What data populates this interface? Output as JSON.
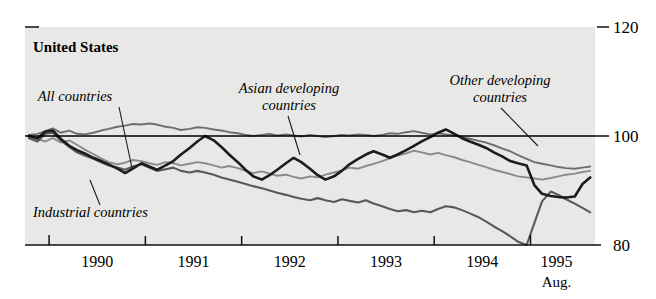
{
  "chart_data": {
    "type": "line",
    "title": "United States",
    "xlabel": "",
    "ylabel": "",
    "ylim": [
      80,
      120
    ],
    "yticks": [
      80,
      100,
      120
    ],
    "ytick_labels": [
      "80",
      "100",
      "120"
    ],
    "xlim": [
      1989.75,
      1995.67
    ],
    "xticks": [
      1990,
      1991,
      1992,
      1993,
      1994,
      1995
    ],
    "xtick_labels": [
      "1990",
      "1991",
      "1992",
      "1993",
      "1994",
      "1995"
    ],
    "x_end_note": "Aug.",
    "grid": false,
    "legend_position": "inline-annotations",
    "reference_line": 100,
    "annotations": [
      {
        "text": "All countries",
        "x": 1990.55,
        "y": 112.0
      },
      {
        "text": "Asian developing countries",
        "x": 1992.05,
        "y": 113.5
      },
      {
        "text": "Other developing countries",
        "x": 1994.35,
        "y": 114.5
      },
      {
        "text": "Industrial countries",
        "x": 1990.65,
        "y": 85.5
      }
    ],
    "x": [
      1989.79,
      1989.88,
      1989.96,
      1990.04,
      1990.12,
      1990.21,
      1990.29,
      1990.37,
      1990.46,
      1990.54,
      1990.62,
      1990.71,
      1990.79,
      1990.87,
      1990.96,
      1991.04,
      1991.12,
      1991.21,
      1991.29,
      1991.37,
      1991.46,
      1991.54,
      1991.62,
      1991.71,
      1991.79,
      1991.87,
      1991.96,
      1992.04,
      1992.12,
      1992.21,
      1992.29,
      1992.37,
      1992.46,
      1992.54,
      1992.62,
      1992.71,
      1992.79,
      1992.87,
      1992.96,
      1993.04,
      1993.12,
      1993.21,
      1993.29,
      1993.37,
      1993.46,
      1993.54,
      1993.62,
      1993.71,
      1993.79,
      1993.87,
      1993.96,
      1994.04,
      1994.12,
      1994.21,
      1994.29,
      1994.37,
      1994.46,
      1994.54,
      1994.62,
      1994.71,
      1994.79,
      1994.87,
      1994.96,
      1995.04,
      1995.12,
      1995.21,
      1995.29,
      1995.37,
      1995.46,
      1995.54,
      1995.62
    ],
    "series": [
      {
        "name": "All countries",
        "color": "#6e6e6e",
        "width": 1.9,
        "values": [
          100.2,
          100.4,
          100.9,
          101.4,
          100.6,
          101.0,
          100.4,
          100.3,
          100.6,
          101.0,
          101.3,
          101.7,
          101.9,
          102.2,
          102.1,
          102.3,
          102.1,
          101.7,
          101.5,
          101.1,
          101.3,
          101.6,
          101.5,
          101.2,
          101.0,
          100.7,
          100.5,
          100.2,
          100.0,
          100.2,
          100.4,
          100.1,
          100.3,
          100.1,
          99.9,
          100.2,
          100.0,
          99.8,
          100.0,
          100.2,
          100.1,
          100.3,
          100.2,
          100.0,
          100.2,
          100.5,
          100.4,
          100.7,
          100.9,
          100.6,
          100.3,
          100.5,
          100.3,
          100.1,
          99.8,
          99.5,
          99.1,
          98.8,
          98.3,
          97.7,
          97.2,
          96.5,
          95.8,
          95.2,
          94.9,
          94.6,
          94.3,
          94.1,
          94.0,
          94.2,
          94.4
        ]
      },
      {
        "name": "Asian developing countries",
        "color": "#8a8a8a",
        "width": 1.9,
        "values": [
          99.8,
          99.4,
          99.0,
          99.6,
          98.8,
          99.2,
          98.4,
          97.5,
          96.7,
          95.9,
          95.2,
          94.8,
          95.1,
          95.6,
          95.4,
          95.0,
          94.7,
          95.2,
          95.0,
          94.6,
          94.9,
          95.2,
          95.0,
          94.6,
          94.2,
          94.5,
          94.1,
          93.6,
          93.2,
          93.5,
          93.1,
          92.7,
          92.9,
          92.5,
          92.2,
          92.6,
          92.4,
          92.9,
          93.3,
          93.7,
          94.2,
          94.0,
          94.5,
          94.9,
          95.4,
          95.9,
          96.4,
          96.8,
          97.3,
          97.0,
          96.6,
          96.9,
          96.5,
          96.1,
          95.6,
          95.2,
          94.7,
          94.3,
          93.8,
          93.4,
          93.0,
          92.6,
          92.4,
          92.2,
          92.0,
          92.3,
          92.6,
          92.9,
          93.1,
          93.4,
          93.6
        ]
      },
      {
        "name": "Industrial countries",
        "color": "#595959",
        "width": 2.1,
        "values": [
          99.6,
          99.0,
          100.4,
          100.6,
          99.2,
          98.0,
          97.0,
          96.4,
          95.8,
          95.2,
          94.6,
          94.2,
          93.8,
          94.4,
          94.8,
          94.2,
          93.6,
          93.9,
          94.2,
          93.6,
          93.3,
          93.6,
          93.3,
          92.9,
          92.4,
          92.0,
          91.6,
          91.2,
          90.8,
          90.4,
          90.0,
          89.6,
          89.2,
          88.8,
          88.5,
          88.2,
          88.6,
          88.2,
          87.9,
          88.4,
          88.1,
          87.8,
          88.2,
          87.6,
          87.1,
          86.6,
          86.2,
          86.4,
          86.0,
          86.3,
          86.0,
          86.6,
          87.1,
          86.9,
          86.4,
          85.8,
          85.1,
          84.3,
          83.4,
          82.5,
          81.6,
          80.6,
          80.0,
          84.0,
          88.0,
          89.8,
          89.2,
          88.4,
          87.6,
          86.8,
          86.0
        ]
      },
      {
        "name": "Other developing countries",
        "color": "#1c1c1c",
        "width": 2.6,
        "values": [
          100.0,
          99.6,
          100.8,
          101.0,
          99.5,
          98.2,
          97.4,
          96.8,
          96.0,
          95.4,
          94.8,
          94.0,
          93.2,
          94.0,
          95.0,
          94.4,
          93.8,
          94.6,
          95.4,
          96.6,
          97.8,
          99.0,
          100.0,
          99.2,
          98.0,
          96.6,
          95.2,
          93.8,
          92.6,
          92.0,
          92.8,
          93.8,
          95.0,
          96.0,
          95.2,
          94.0,
          92.8,
          92.0,
          92.6,
          93.6,
          94.8,
          95.8,
          96.6,
          97.2,
          96.6,
          96.0,
          96.6,
          97.4,
          98.2,
          99.0,
          99.8,
          100.6,
          101.2,
          100.4,
          99.6,
          99.0,
          98.4,
          97.8,
          97.0,
          96.2,
          95.4,
          95.0,
          94.6,
          91.0,
          89.4,
          89.0,
          88.8,
          88.7,
          88.9,
          91.2,
          92.4
        ]
      }
    ]
  },
  "layout": {
    "plot_left": 25,
    "plot_right": 595,
    "plot_top": 27,
    "plot_bottom": 245,
    "background": "#e8e8e6",
    "page_background": "#ffffff"
  }
}
